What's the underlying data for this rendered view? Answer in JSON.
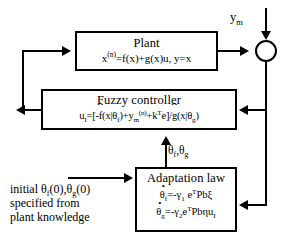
{
  "diagram": {
    "plant": {
      "title": "Plant",
      "equation": "x(n)=f(x)+g(x)u,  y=x",
      "equation_parts": {
        "lhs": "x",
        "lhs_sup": "(n)",
        "rhs": "=f(x)+g(x)u,  y=x"
      }
    },
    "fuzzy_controller": {
      "title": "Fuzzy controller",
      "equation": "uI=[-f(x|θf)+ym(n)+kTe]/g(x|θg)",
      "equation_parts": {
        "u": "u",
        "u_sub": "I",
        "eq": "=[-",
        "f_hat": "f",
        "f_args": "(x|θ",
        "f_sub": "f",
        "f_close": ")+y",
        "ym_sub": "m",
        "ym_sup": "(n)",
        "plus_k": "+k",
        "k_sup": "T",
        "e_close": "e]/",
        "g_hat": "g",
        "g_args": "(x|θ",
        "g_sub": "g",
        "g_close": ")"
      }
    },
    "adaptation_law": {
      "title": "Adaptation law",
      "equation_1": "θ̇f=-γ1 eTPbξ",
      "equation_2": "θ̇g=-γ2 eTPbηuI",
      "equation_1_parts": {
        "theta": "θ",
        "theta_sub": "f",
        "eq": "=-γ",
        "gamma_sub": "1",
        "e": " e",
        "e_sup": "T",
        "tail": "Pbξ"
      },
      "equation_2_parts": {
        "theta": "θ",
        "theta_sub": "g",
        "eq": "=-γ",
        "gamma_sub": "2",
        "e": "e",
        "e_sup": "T",
        "tail": "Pbηu",
        "tail_sub": "I"
      }
    },
    "labels": {
      "ym": "y",
      "ym_sub": "m",
      "theta_feedback": "θ",
      "theta_feedback_sub_1": "f",
      "theta_feedback_mid": ",θ",
      "theta_feedback_sub_2": "g",
      "initial_line_1_a": "initial θ",
      "initial_line_1_sub_1": "f",
      "initial_line_1_b": "(0),θ",
      "initial_line_1_sub_2": "g",
      "initial_line_1_c": "(0)",
      "initial_line_2": "specified from",
      "initial_line_3": "plant knowledge"
    },
    "nodes": {
      "summing_junction": "summing-junction"
    },
    "colors": {
      "line": "#000000",
      "background": "#ffffff"
    }
  }
}
